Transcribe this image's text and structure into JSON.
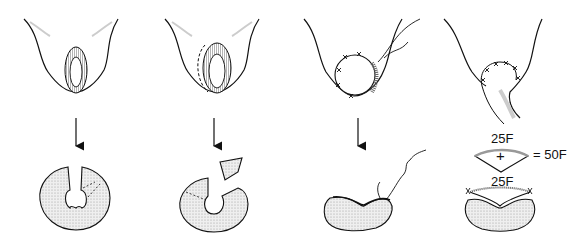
{
  "figure": {
    "type": "surgical-illustration",
    "panels": [
      {
        "id": 1,
        "top": "perineal opening with hatched ring (urethral meatus outline)",
        "bottom": "round tissue disc with keyhole notch and dotted cut lines"
      },
      {
        "id": 2,
        "top": "ring with dashed incision line along left side",
        "bottom": "disc with wedge segment removed and separated"
      },
      {
        "id": 3,
        "top": "circular sutured closure with suture thread",
        "bottom": "kidney-shaped folded disc with suture thread"
      },
      {
        "id": 4,
        "top": "sutured arch with tissue flap extending downward",
        "bottom": "kidney-shaped disc with graft segment sutured on top"
      }
    ],
    "labels": {
      "upper_segment": "25F",
      "plus": "+",
      "equals": "= 50F",
      "lower_segment": "25F"
    },
    "colors": {
      "line": "#111111",
      "shade": "#bdbdbd",
      "stipple": "#e6e6e6"
    }
  }
}
